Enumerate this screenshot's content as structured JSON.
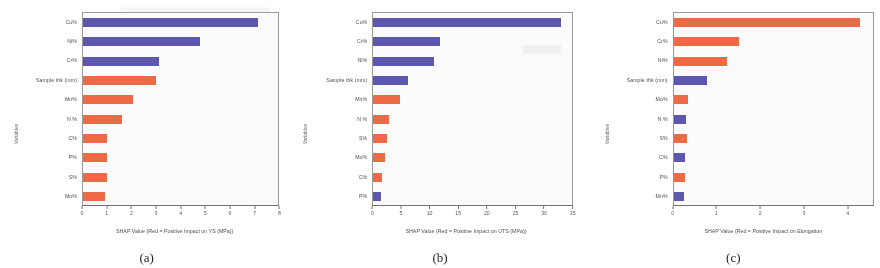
{
  "figure": {
    "panels": [
      {
        "caption": "(a)",
        "yaxis_title": "Variables",
        "xaxis_title": "SHAP Value (Red = Positive Impact on YS (MPa))",
        "xticks": [
          "0",
          "1",
          "2",
          "3",
          "4",
          "5",
          "6",
          "7",
          "8"
        ]
      },
      {
        "caption": "(b)",
        "yaxis_title": "Variables",
        "xaxis_title": "SHAP Value (Red = Positive Impact on UTS (MPa))",
        "xticks": [
          "0",
          "5",
          "10",
          "15",
          "20",
          "25",
          "30",
          "35"
        ]
      },
      {
        "caption": "(c)",
        "yaxis_title": "Variables",
        "xaxis_title": "SHAP Value (Red = Positive Impact on Elongation",
        "xticks": [
          "0",
          "1",
          "2",
          "3",
          "4"
        ]
      }
    ]
  },
  "colors": {
    "red": "#f05a32",
    "blue": "#4b46a8",
    "axis": "#6f6f6f",
    "text": "#4a4a4a"
  },
  "chart_data": [
    {
      "type": "bar",
      "orientation": "horizontal",
      "title": "(a)",
      "xlabel": "SHAP Value (Red = Positive Impact on YS (MPa))",
      "ylabel": "Variables",
      "xlim": [
        0,
        8
      ],
      "xticks": [
        0,
        1,
        2,
        3,
        4,
        5,
        6,
        7,
        8
      ],
      "grid": false,
      "legend": "none",
      "categories": [
        "Cu%",
        "Ni%",
        "Cr%",
        "Sample thk (mm)",
        "Mn%",
        "N %",
        "C%",
        "P%",
        "S%",
        "Mo%"
      ],
      "values": [
        7.15,
        4.8,
        3.1,
        3.0,
        2.05,
        1.6,
        0.98,
        0.97,
        0.97,
        0.92
      ],
      "colors": [
        "blue",
        "blue",
        "blue",
        "red",
        "red",
        "red",
        "red",
        "red",
        "red",
        "red"
      ]
    },
    {
      "type": "bar",
      "orientation": "horizontal",
      "title": "(b)",
      "xlabel": "SHAP Value (Red = Positive Impact on UTS (MPa))",
      "ylabel": "Variables",
      "xlim": [
        0,
        35
      ],
      "xticks": [
        0,
        5,
        10,
        15,
        20,
        25,
        30,
        35
      ],
      "grid": false,
      "legend": "none",
      "categories": [
        "Cu%",
        "Cr%",
        "Ni%",
        "Sample thk (mm)",
        "Mn%",
        "N %",
        "S%",
        "Mo%",
        "C%",
        "P%"
      ],
      "values": [
        33.2,
        11.8,
        10.7,
        6.1,
        4.7,
        2.7,
        2.4,
        2.0,
        1.5,
        1.4
      ],
      "colors": [
        "blue",
        "blue",
        "blue",
        "blue",
        "red",
        "red",
        "red",
        "red",
        "red",
        "blue"
      ]
    },
    {
      "type": "bar",
      "orientation": "horizontal",
      "title": "(c)",
      "xlabel": "SHAP Value (Red = Positive Impact on Elongation",
      "ylabel": "Variables",
      "xlim": [
        0,
        4.6
      ],
      "xticks": [
        0,
        1,
        2,
        3,
        4
      ],
      "grid": false,
      "legend": "none",
      "categories": [
        "Cu%",
        "Cr%",
        "Ni%",
        "Sample thk (mm)",
        "Mo%",
        "N %",
        "S%",
        "C%",
        "P%",
        "Mn%"
      ],
      "values": [
        4.3,
        1.5,
        1.23,
        0.76,
        0.34,
        0.29,
        0.3,
        0.26,
        0.26,
        0.24
      ],
      "colors": [
        "red",
        "red",
        "red",
        "blue",
        "red",
        "blue",
        "red",
        "blue",
        "red",
        "blue"
      ]
    }
  ]
}
